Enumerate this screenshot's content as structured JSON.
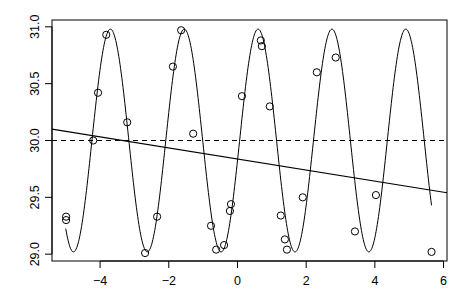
{
  "chart_data": {
    "type": "scatter",
    "title": "",
    "xlabel": "",
    "ylabel": "",
    "xlim": [
      -5.4,
      6.1
    ],
    "ylim": [
      28.94,
      31.06
    ],
    "grid": false,
    "legend": "none",
    "x_ticks": [
      -4,
      -2,
      0,
      2,
      4,
      6
    ],
    "x_tick_labels": [
      "−4",
      "−2",
      "0",
      "2",
      "4",
      "6"
    ],
    "y_ticks": [
      29.0,
      29.5,
      30.0,
      30.5,
      31.0
    ],
    "y_tick_labels": [
      "29.0",
      "29.5",
      "30.0",
      "30.5",
      "31.0"
    ],
    "points": {
      "name": "observations",
      "marker": "open-circle",
      "x": [
        -4.99,
        -4.99,
        -4.2,
        -4.06,
        -3.82,
        -3.21,
        -2.69,
        -2.34,
        -1.88,
        -1.64,
        -1.29,
        -0.77,
        -0.62,
        -0.39,
        -0.22,
        -0.19,
        0.13,
        0.68,
        0.71,
        0.94,
        1.26,
        1.38,
        1.44,
        1.9,
        2.31,
        2.86,
        3.42,
        4.03,
        5.65
      ],
      "y": [
        29.33,
        29.3,
        30.0,
        30.42,
        30.93,
        30.16,
        29.01,
        29.33,
        30.65,
        30.97,
        30.06,
        29.25,
        29.04,
        29.08,
        29.38,
        29.44,
        30.39,
        30.88,
        30.83,
        30.3,
        29.34,
        29.13,
        29.04,
        29.5,
        30.6,
        30.73,
        29.2,
        29.52,
        29.02
      ]
    },
    "sine_fit": {
      "name": "sinusoidal fit",
      "style": "solid",
      "mean": 30.0,
      "amplitude": 0.98,
      "period": 2.15,
      "peak_x": 0.6,
      "x_range": [
        -5.0,
        5.65
      ]
    },
    "linear_fit": {
      "name": "linear regression",
      "style": "solid",
      "x": [
        -5.4,
        6.1
      ],
      "y": [
        30.1,
        29.54
      ]
    },
    "mean_line": {
      "name": "mean",
      "style": "dashed",
      "y": 30.0
    }
  }
}
